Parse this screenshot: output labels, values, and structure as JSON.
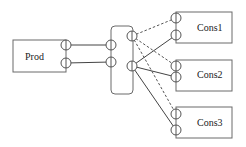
{
  "diagram": {
    "nodes": [
      {
        "id": "prod",
        "label": "Prod",
        "x": 13,
        "y": 40,
        "w": 53,
        "h": 32,
        "rx": 0,
        "label_x": 25,
        "label_y": 60
      },
      {
        "id": "broker",
        "label": "",
        "x": 111,
        "y": 26,
        "w": 22,
        "h": 68,
        "rx": 4,
        "label_x": 0,
        "label_y": 0
      },
      {
        "id": "cons1",
        "label": "Cons1",
        "x": 176,
        "y": 12,
        "w": 56,
        "h": 31,
        "rx": 0,
        "label_x": 197,
        "label_y": 31
      },
      {
        "id": "cons2",
        "label": "Cons2",
        "x": 176,
        "y": 60,
        "w": 56,
        "h": 31,
        "rx": 0,
        "label_x": 197,
        "label_y": 78
      },
      {
        "id": "cons3",
        "label": "Cons3",
        "x": 176,
        "y": 107,
        "w": 56,
        "h": 31,
        "rx": 0,
        "label_x": 197,
        "label_y": 126
      }
    ],
    "ports": [
      {
        "id": "prod-p1",
        "cx": 66,
        "cy": 45
      },
      {
        "id": "prod-p2",
        "cx": 66,
        "cy": 63
      },
      {
        "id": "broker-in1",
        "cx": 111,
        "cy": 45
      },
      {
        "id": "broker-in2",
        "cx": 111,
        "cy": 62
      },
      {
        "id": "broker-out1",
        "cx": 132,
        "cy": 36
      },
      {
        "id": "broker-out2",
        "cx": 132,
        "cy": 66
      },
      {
        "id": "cons1-p1",
        "cx": 176,
        "cy": 18
      },
      {
        "id": "cons1-p2",
        "cx": 176,
        "cy": 35
      },
      {
        "id": "cons2-p1",
        "cx": 176,
        "cy": 66
      },
      {
        "id": "cons2-p2",
        "cx": 176,
        "cy": 77
      },
      {
        "id": "cons3-p1",
        "cx": 176,
        "cy": 114
      },
      {
        "id": "cons3-p2",
        "cx": 176,
        "cy": 130
      }
    ],
    "port_radius": 5,
    "edges": [
      {
        "from": "prod-p1",
        "to": "broker-in1",
        "style": "solid"
      },
      {
        "from": "prod-p2",
        "to": "broker-in2",
        "style": "solid"
      },
      {
        "from": "broker-out1",
        "to": "cons1-p1",
        "style": "dashed"
      },
      {
        "from": "broker-out1",
        "to": "cons2-p1",
        "style": "dashed"
      },
      {
        "from": "broker-out1",
        "to": "cons3-p1",
        "style": "dashed"
      },
      {
        "from": "broker-out2",
        "to": "cons1-p2",
        "style": "solid"
      },
      {
        "from": "broker-out2",
        "to": "cons2-p2",
        "style": "solid"
      },
      {
        "from": "broker-out2",
        "to": "cons3-p2",
        "style": "solid"
      }
    ]
  }
}
